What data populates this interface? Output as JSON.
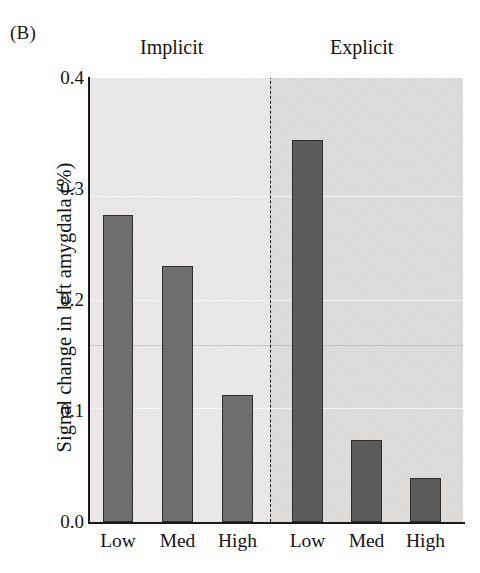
{
  "figure": {
    "panel_letter": "(B)",
    "y_axis_title": "Signal change in left amygdala (%)"
  },
  "chart_data": {
    "type": "bar",
    "title": "",
    "subtitle": "",
    "xlabel": "",
    "ylabel": "Signal change in left amygdala (%)",
    "ylim": [
      0.0,
      0.4
    ],
    "yticks": [
      0.0,
      0.1,
      0.2,
      0.3,
      0.4
    ],
    "ytick_labels": [
      "0.0",
      "0.1",
      "0.2",
      "0.3",
      "0.4"
    ],
    "grid": false,
    "legend": "none",
    "groups": [
      "Implicit",
      "Explicit"
    ],
    "categories": [
      "Low",
      "Med",
      "High"
    ],
    "series": [
      {
        "name": "Implicit",
        "values": [
          0.277,
          0.231,
          0.114
        ],
        "color": "#6e6e6e"
      },
      {
        "name": "Explicit",
        "values": [
          0.344,
          0.074,
          0.04
        ],
        "color": "#5a5a5a"
      }
    ],
    "bars": [
      {
        "group": "Implicit",
        "category": "Low",
        "value": 0.277
      },
      {
        "group": "Implicit",
        "category": "Med",
        "value": 0.231
      },
      {
        "group": "Implicit",
        "category": "High",
        "value": 0.114
      },
      {
        "group": "Explicit",
        "category": "Low",
        "value": 0.344
      },
      {
        "group": "Explicit",
        "category": "Med",
        "value": 0.074
      },
      {
        "group": "Explicit",
        "category": "High",
        "value": 0.04
      }
    ],
    "annotations": [
      "dashed vertical divider separating Implicit and Explicit conditions"
    ],
    "colors": {
      "implicit_bar": "#6e6e6e",
      "explicit_bar": "#5a5a5a",
      "implicit_panel_bg": "#eceaea",
      "explicit_panel_bg": "#e0dedd",
      "axis": "#1a1a1a",
      "bar_outline": "#2b2b2b"
    }
  },
  "y_ticks": [
    {
      "label": "0.4",
      "value": 0.4
    },
    {
      "label": "0.3",
      "value": 0.3
    },
    {
      "label": "0.2",
      "value": 0.2
    },
    {
      "label": "0.1",
      "value": 0.1
    },
    {
      "label": "0.0",
      "value": 0.0
    }
  ],
  "x_ticks": [
    {
      "label": "Low"
    },
    {
      "label": "Med"
    },
    {
      "label": "High"
    },
    {
      "label": "Low"
    },
    {
      "label": "Med"
    },
    {
      "label": "High"
    }
  ],
  "headers": {
    "implicit": "Implicit",
    "explicit": "Explicit"
  }
}
